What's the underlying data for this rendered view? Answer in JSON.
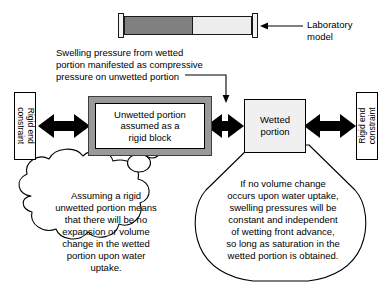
{
  "lab_model": {
    "label_line1": "Laboratory",
    "label_line2": "model",
    "dry_segment_name": "unwetted (dry) portion",
    "wet_segment_name": "wetted portion",
    "dry_fill_color": "#808080",
    "wet_fill_color": "#ededed",
    "endcap_fill_color": "#f2f2f2",
    "outline_color": "#000000"
  },
  "pressure_note": {
    "line1": "Swelling pressure from wetted",
    "line2": "portion manifested as compressive",
    "line3": "pressure on unwetted portion"
  },
  "boxes": {
    "left_constraint": {
      "line1": "Rigid end",
      "line2": "constraint"
    },
    "right_constraint": {
      "line1": "Rigid end",
      "line2": "constraint"
    },
    "unwetted": {
      "line1": "Unwetted portion",
      "line2": "assumed as a",
      "line3": "rigid block",
      "border_color": "#999999",
      "fill_color": "#ffffff"
    },
    "wetted": {
      "line1": "Wetted",
      "line2": "portion",
      "fill_color": "#f0f0f0",
      "border_color": "#000000"
    }
  },
  "arrows": {
    "count": 3,
    "style": "double-headed",
    "color": "#000000",
    "names": [
      "left-constraint-to-unwetted",
      "unwetted-to-wetted",
      "wetted-to-right-constraint"
    ]
  },
  "cloud_callout": {
    "line1": "Assuming a rigid",
    "line2": "unwetted portion means",
    "line3": "that there will be no",
    "line4": "expansion or volume",
    "line5": "change in the wetted",
    "line6": "portion upon water",
    "line7": "uptake.",
    "points_to": "unwetted-portion-box"
  },
  "balloon_callout": {
    "line1": "If no volume change",
    "line2": "occurs upon water uptake,",
    "line3": "swelling pressures will be",
    "line4": "constant and independent",
    "line5": "of  wetting front advance,",
    "line6": "so long as saturation in the",
    "line7": "wetted portion is obtained.",
    "points_to": "wetted-portion-box"
  }
}
